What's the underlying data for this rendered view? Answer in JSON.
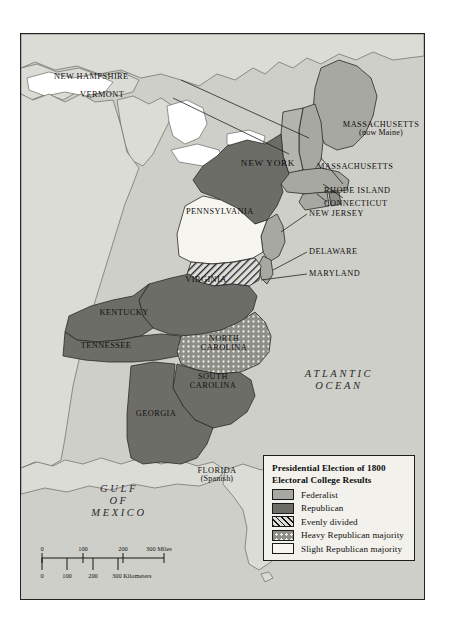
{
  "map": {
    "title_region": "Eastern United States, 1800",
    "ocean_labels": [
      {
        "name": "atlantic-ocean",
        "line1": "ATLANTIC",
        "line2": "OCEAN"
      },
      {
        "name": "gulf-of-mexico",
        "line1": "GULF",
        "line2": "OF",
        "line3": "MEXICO"
      }
    ],
    "states": [
      {
        "id": "new-hampshire",
        "label": "NEW HAMPSHIRE",
        "category": "Federalist"
      },
      {
        "id": "vermont",
        "label": "VERMONT",
        "category": "Federalist"
      },
      {
        "id": "massachusetts-maine",
        "label": "MASSACHUSETTS",
        "sublabel": "(now Maine)",
        "category": "Federalist"
      },
      {
        "id": "massachusetts",
        "label": "MASSACHUSETTS",
        "category": "Federalist"
      },
      {
        "id": "rhode-island",
        "label": "RHODE ISLAND",
        "category": "Federalist"
      },
      {
        "id": "connecticut",
        "label": "CONNECTICUT",
        "category": "Federalist"
      },
      {
        "id": "new-york",
        "label": "NEW YORK",
        "category": "Republican"
      },
      {
        "id": "new-jersey",
        "label": "NEW JERSEY",
        "category": "Federalist"
      },
      {
        "id": "pennsylvania",
        "label": "PENNSYLVANIA",
        "category": "Slight Republican majority"
      },
      {
        "id": "delaware",
        "label": "DELAWARE",
        "category": "Federalist"
      },
      {
        "id": "maryland",
        "label": "MARYLAND",
        "category": "Evenly divided"
      },
      {
        "id": "virginia",
        "label": "VIRGINIA",
        "category": "Republican"
      },
      {
        "id": "kentucky",
        "label": "KENTUCKY",
        "category": "Republican"
      },
      {
        "id": "tennessee",
        "label": "TENNESSEE",
        "category": "Republican"
      },
      {
        "id": "north-carolina",
        "label": "NORTH CAROLINA",
        "category": "Heavy Republican majority"
      },
      {
        "id": "south-carolina",
        "label": "SOUTH CAROLINA",
        "category": "Republican"
      },
      {
        "id": "georgia",
        "label": "GEORGIA",
        "category": "Republican"
      },
      {
        "id": "florida",
        "label": "FLORIDA",
        "sublabel": "(Spanish)",
        "category": "Non-state territory"
      }
    ]
  },
  "legend": {
    "title_line1": "Presidential Election of 1800",
    "title_line2": "Electoral College Results",
    "items": [
      {
        "key": "federalist",
        "label": "Federalist",
        "swatch": "sw-fed",
        "color": "#a8a8a2"
      },
      {
        "key": "republican",
        "label": "Republican",
        "swatch": "sw-rep",
        "color": "#6d6d68"
      },
      {
        "key": "evenly-divided",
        "label": "Evenly divided",
        "swatch": "sw-even",
        "color": "#ddddd6"
      },
      {
        "key": "heavy-republican",
        "label": "Heavy Republican majority",
        "swatch": "sw-heavy",
        "color": "#8e8e88"
      },
      {
        "key": "slight-republican",
        "label": "Slight Republican majority",
        "swatch": "sw-slight",
        "color": "#f6f5f0"
      }
    ]
  },
  "scalebar": {
    "miles": {
      "ticks": [
        "0",
        "100",
        "200"
      ],
      "unit": "300 Miles"
    },
    "kilometers": {
      "ticks": [
        "0",
        "100",
        "200"
      ],
      "unit": "300 Kilometers"
    }
  }
}
